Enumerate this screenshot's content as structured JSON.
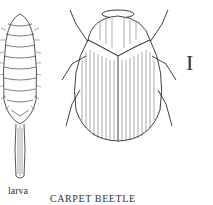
{
  "illustration": {
    "title": "CARPET BEETLE",
    "larva_label": "larva",
    "plate_mark": "I",
    "ink_color": "#2a2a2a",
    "background": "#ffffff"
  }
}
